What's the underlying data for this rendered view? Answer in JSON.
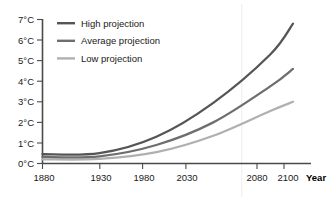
{
  "chart_data": {
    "type": "line",
    "title": "",
    "subtitle": "",
    "xlabel": "Year",
    "ylabel": "",
    "x": [
      1880,
      1930,
      1980,
      2030,
      2080,
      2100
    ],
    "xlim": [
      1880,
      2100
    ],
    "ylim": [
      0,
      7
    ],
    "xticks": [
      1880,
      1930,
      1980,
      2030,
      2080,
      2100
    ],
    "xticklabels": [
      "1880",
      "1930",
      "1980",
      "2030",
      "2080",
      "2100"
    ],
    "yticks": [
      0,
      1,
      2,
      3,
      4,
      5,
      6,
      7
    ],
    "yticklabels": [
      "0°C",
      "1°C",
      "2°C",
      "3°C",
      "4°C",
      "5°C",
      "6°C",
      "7°C"
    ],
    "grid": false,
    "vertical_guide_year": 2055,
    "legend_position": "upper-left",
    "series": [
      {
        "name": "High projection",
        "color": "#555555",
        "values": [
          0.45,
          0.5,
          1.3,
          2.95,
          5.3,
          6.8
        ]
      },
      {
        "name": "Average projection",
        "color": "#6e6e6e",
        "values": [
          0.32,
          0.35,
          0.9,
          2.0,
          3.75,
          4.6
        ]
      },
      {
        "name": "Low projection",
        "color": "#b0b0b0",
        "values": [
          0.2,
          0.22,
          0.55,
          1.35,
          2.55,
          3.0
        ]
      }
    ]
  },
  "axes": {
    "x_axis_title": "Year"
  },
  "legend": {
    "items": [
      {
        "label": "High projection",
        "color": "#555555"
      },
      {
        "label": "Average projection",
        "color": "#6e6e6e"
      },
      {
        "label": "Low projection",
        "color": "#b0b0b0"
      }
    ]
  },
  "yticks": {
    "labels": [
      "7°C",
      "6°C",
      "5°C",
      "4°C",
      "3°C",
      "2°C",
      "1°C",
      "0°C"
    ]
  },
  "xticks": {
    "labels": [
      "1880",
      "1930",
      "1980",
      "2030",
      "2080",
      "2100"
    ]
  }
}
